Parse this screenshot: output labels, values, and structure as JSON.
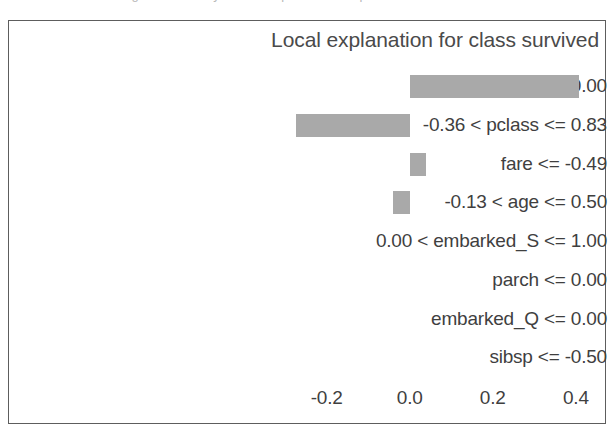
{
  "page": {
    "clipped_caption": "Figure: LIME-style local explanation output"
  },
  "chart_data": {
    "type": "bar",
    "orientation": "horizontal",
    "title": "Local explanation for class survived",
    "xlabel": "",
    "ylabel": "",
    "grid": false,
    "legend": null,
    "xlim": [
      -0.31,
      0.475
    ],
    "xticks": [
      -0.2,
      0.0,
      0.2,
      0.4
    ],
    "xtick_labels": [
      "-0.2",
      "0.0",
      "0.2",
      "0.4"
    ],
    "bar_color": "#a9a9a9",
    "frame_color": "#5d5d5d",
    "text_color": "#3f3f3f",
    "categories": [
      "sex_male <= 0.00",
      "-0.36 < pclass <= 0.83",
      "fare <= -0.49",
      "-0.13 < age <= 0.50",
      "0.00 < embarked_S <= 1.00",
      "parch <= 0.00",
      "embarked_Q <= 0.00",
      "sibsp <= -0.50"
    ],
    "values": [
      0.407,
      -0.273,
      0.04,
      -0.04,
      0.0,
      0.0,
      0.0,
      0.0
    ]
  }
}
